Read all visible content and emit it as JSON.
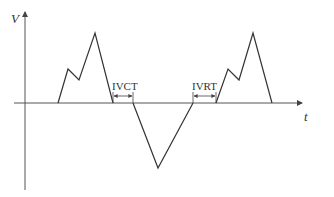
{
  "axes": {
    "y_label": "V",
    "x_label": "t"
  },
  "annotations": {
    "ivct": "IVCT",
    "ivrt": "IVRT"
  },
  "colors": {
    "line": "#333333",
    "axis": "#555555"
  }
}
